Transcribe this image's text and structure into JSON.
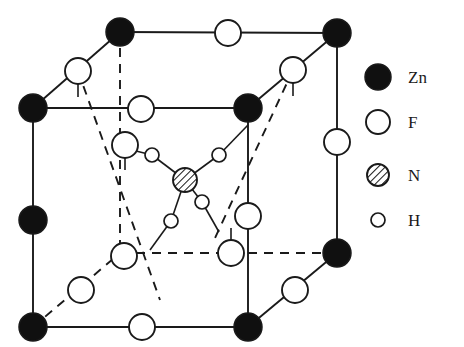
{
  "figure": {
    "name": "crystal-structure-unit-cell",
    "colors": {
      "stroke": "#1a1a1a",
      "fill_solid": "#101010",
      "fill_open": "#ffffff",
      "hatch": "#1a1a1a",
      "background": "#ffffff"
    }
  },
  "legend": {
    "items": [
      {
        "symbol": "filled-circle",
        "label": "Zn",
        "radius": 13,
        "cx": 378,
        "cy": 77
      },
      {
        "symbol": "open-circle",
        "label": "F",
        "radius": 12,
        "cx": 378,
        "cy": 122
      },
      {
        "symbol": "hatched-circle",
        "label": "N",
        "radius": 11,
        "cx": 378,
        "cy": 175
      },
      {
        "symbol": "small-open-circle",
        "label": "H",
        "radius": 7,
        "cx": 378,
        "cy": 220
      }
    ],
    "label_x": 408
  },
  "atoms": {
    "zn": [
      {
        "id": "zn-top-back-left",
        "cx": 120,
        "cy": 32,
        "r": 14
      },
      {
        "id": "zn-top-back-right",
        "cx": 337,
        "cy": 33,
        "r": 14
      },
      {
        "id": "zn-top-front-left",
        "cx": 33,
        "cy": 108,
        "r": 14
      },
      {
        "id": "zn-top-front-right",
        "cx": 248,
        "cy": 108,
        "r": 14
      },
      {
        "id": "zn-mid-front-left",
        "cx": 33,
        "cy": 220,
        "r": 14
      },
      {
        "id": "zn-bottom-back-right",
        "cx": 337,
        "cy": 253,
        "r": 14
      },
      {
        "id": "zn-bottom-front-left",
        "cx": 33,
        "cy": 327,
        "r": 14
      },
      {
        "id": "zn-bottom-front-right",
        "cx": 248,
        "cy": 327,
        "r": 14
      }
    ],
    "f": [
      {
        "id": "f-top-back-edge",
        "cx": 228,
        "cy": 33,
        "r": 13
      },
      {
        "id": "f-top-left-diag",
        "cx": 78,
        "cy": 71,
        "r": 13
      },
      {
        "id": "f-top-right-diag",
        "cx": 293,
        "cy": 70,
        "r": 13
      },
      {
        "id": "f-top-face-center",
        "cx": 141,
        "cy": 109,
        "r": 13
      },
      {
        "id": "f-right-back-edge",
        "cx": 337,
        "cy": 142,
        "r": 13
      },
      {
        "id": "f-upper-inner-left",
        "cx": 125,
        "cy": 145,
        "r": 13
      },
      {
        "id": "f-front-center-edge",
        "cx": 248,
        "cy": 216,
        "r": 13
      },
      {
        "id": "f-lower-inner-left",
        "cx": 124,
        "cy": 256,
        "r": 13
      },
      {
        "id": "f-lower-inner-right",
        "cx": 231,
        "cy": 253,
        "r": 13
      },
      {
        "id": "f-bottom-back-diag",
        "cx": 81,
        "cy": 290,
        "r": 13
      },
      {
        "id": "f-bottom-right-diag",
        "cx": 295,
        "cy": 290,
        "r": 13
      },
      {
        "id": "f-bottom-front-edge",
        "cx": 142,
        "cy": 327,
        "r": 13
      }
    ],
    "n": [
      {
        "id": "n-center",
        "cx": 185,
        "cy": 180,
        "r": 12
      }
    ],
    "h": [
      {
        "id": "h-upper-left",
        "cx": 152,
        "cy": 155,
        "r": 7
      },
      {
        "id": "h-upper-right",
        "cx": 219,
        "cy": 155,
        "r": 7
      },
      {
        "id": "h-lower-right",
        "cx": 202,
        "cy": 202,
        "r": 7
      },
      {
        "id": "h-lower-left",
        "cx": 171,
        "cy": 221,
        "r": 7
      }
    ]
  },
  "bonds": {
    "solid_edges": [
      {
        "id": "edge-top-back",
        "x1": 120,
        "y1": 32,
        "x2": 337,
        "y2": 33
      },
      {
        "id": "edge-top-left-diag",
        "x1": 120,
        "y1": 32,
        "x2": 33,
        "y2": 108
      },
      {
        "id": "edge-top-right-diag",
        "x1": 337,
        "y1": 33,
        "x2": 248,
        "y2": 108
      },
      {
        "id": "edge-top-front",
        "x1": 33,
        "y1": 108,
        "x2": 248,
        "y2": 108
      },
      {
        "id": "edge-left-front-vertical",
        "x1": 33,
        "y1": 108,
        "x2": 33,
        "y2": 327
      },
      {
        "id": "edge-right-back-vertical",
        "x1": 337,
        "y1": 33,
        "x2": 337,
        "y2": 253
      },
      {
        "id": "edge-center-front-vertical",
        "x1": 248,
        "y1": 108,
        "x2": 248,
        "y2": 327
      },
      {
        "id": "edge-bottom-front",
        "x1": 33,
        "y1": 327,
        "x2": 248,
        "y2": 327
      },
      {
        "id": "edge-bottom-right-diag",
        "x1": 248,
        "y1": 327,
        "x2": 337,
        "y2": 253
      }
    ],
    "dashed_edges": [
      {
        "id": "edge-back-vertical-dashed",
        "x1": 120,
        "y1": 32,
        "x2": 120,
        "y2": 253
      },
      {
        "id": "edge-bottom-back-dashed",
        "x1": 120,
        "y1": 253,
        "x2": 337,
        "y2": 253
      },
      {
        "id": "edge-bottom-back-left-diag-dashed",
        "x1": 33,
        "y1": 327,
        "x2": 120,
        "y2": 253
      },
      {
        "id": "edge-inner-left-dashed",
        "x1": 78,
        "y1": 71,
        "x2": 160,
        "y2": 300
      },
      {
        "id": "edge-inner-right-dashed",
        "x1": 293,
        "y1": 70,
        "x2": 215,
        "y2": 238
      }
    ],
    "nh_bonds": [
      {
        "id": "bond-n-h-upper-left",
        "x1": 185,
        "y1": 180,
        "x2": 152,
        "y2": 155
      },
      {
        "id": "bond-n-h-upper-right",
        "x1": 185,
        "y1": 180,
        "x2": 219,
        "y2": 155
      },
      {
        "id": "bond-n-h-lower-right",
        "x1": 185,
        "y1": 180,
        "x2": 202,
        "y2": 202
      },
      {
        "id": "bond-n-h-lower-left",
        "x1": 185,
        "y1": 180,
        "x2": 171,
        "y2": 221
      }
    ],
    "hf_bonds": [
      {
        "id": "bond-h-f-upper-left",
        "x1": 152,
        "y1": 155,
        "x2": 132,
        "y2": 150
      },
      {
        "id": "bond-h-f-upper-right",
        "x1": 219,
        "y1": 155,
        "x2": 248,
        "y2": 125
      },
      {
        "id": "bond-h-f-lower-right",
        "x1": 202,
        "y1": 202,
        "x2": 219,
        "y2": 232
      },
      {
        "id": "bond-h-f-lower-left",
        "x1": 171,
        "y1": 221,
        "x2": 150,
        "y2": 250
      }
    ],
    "f_stubs": [
      {
        "id": "stub-f-top-left-diag",
        "x1": 78,
        "y1": 84,
        "x2": 78,
        "y2": 97
      },
      {
        "id": "stub-f-top-right-diag",
        "x1": 293,
        "y1": 83,
        "x2": 293,
        "y2": 96
      },
      {
        "id": "stub-f-upper-inner-left",
        "x1": 125,
        "y1": 158,
        "x2": 125,
        "y2": 170
      },
      {
        "id": "stub-f-lower-inner-right",
        "x1": 231,
        "y1": 240,
        "x2": 231,
        "y2": 228
      }
    ]
  }
}
